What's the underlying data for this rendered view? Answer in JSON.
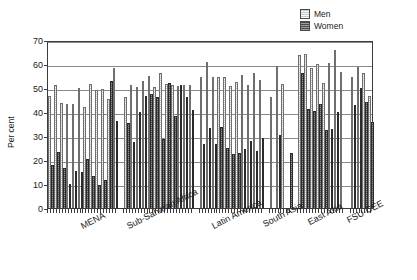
{
  "chart_data": {
    "type": "bar",
    "title": "",
    "subtitle": "",
    "xlabel": "",
    "ylabel": "Per cent",
    "ylim": [
      0,
      70
    ],
    "ytick_values": [
      0,
      10,
      20,
      30,
      40,
      50,
      60,
      70
    ],
    "ytick_labels": [
      "0",
      "10",
      "20",
      "30",
      "40",
      "50",
      "60",
      "70"
    ],
    "grid": "horizontal",
    "legend_position": "top-right",
    "legend": [
      "Men",
      "Women"
    ],
    "series_colors": {
      "Men": "#c6c6c6",
      "Women": "#4f4f4f"
    },
    "groups": [
      {
        "label": "MENA",
        "pairs": [
          {
            "men": 46.5,
            "women": 17.8
          },
          {
            "men": 51.3,
            "women": 23.2
          },
          {
            "men": 43.6,
            "women": 16.8
          },
          {
            "men": 43.3,
            "women": 10.2
          },
          {
            "men": 43.4,
            "women": 15.3
          },
          {
            "men": 50.1,
            "women": 14.8
          },
          {
            "men": 41.9,
            "women": 20.3
          },
          {
            "men": 51.5,
            "women": 13.5
          },
          {
            "men": 49.3,
            "women": 9.6
          },
          {
            "men": 49.4,
            "women": 11.5
          },
          {
            "men": 45.6,
            "women": 52.8
          },
          {
            "men": 58.4,
            "women": 36.2
          }
        ]
      },
      {
        "label": "Sub-Saharan Africa",
        "pairs": [
          {
            "men": 46.4,
            "women": 35.6
          },
          {
            "men": 51.4,
            "women": 27.3
          },
          {
            "men": 50.6,
            "women": 40.2
          },
          {
            "men": 53.0,
            "women": 46.6
          },
          {
            "men": 54.8,
            "women": 47.3
          },
          {
            "men": 50.4,
            "women": 46.4
          },
          {
            "men": 56.3,
            "women": 28.8
          },
          {
            "men": 51.7,
            "women": 52.0
          },
          {
            "men": 51.4,
            "women": 38.3
          },
          {
            "men": 50.9,
            "women": 51.3
          },
          {
            "men": 51.2,
            "women": 46.4
          },
          {
            "men": 51.2,
            "women": 41.0
          }
        ]
      },
      {
        "label": "Latin America",
        "pairs": [
          {
            "men": 54.6,
            "women": 26.6
          },
          {
            "men": 60.8,
            "women": 33.2
          },
          {
            "men": 54.4,
            "women": 26.7
          },
          {
            "men": 54.5,
            "women": 33.8
          },
          {
            "men": 54.7,
            "women": 25.0
          },
          {
            "men": 51.0,
            "women": 22.4
          },
          {
            "men": 52.3,
            "women": 23.1
          },
          {
            "men": 55.6,
            "women": 24.5
          },
          {
            "men": 51.4,
            "women": 27.8
          },
          {
            "men": 56.2,
            "women": 23.7
          },
          {
            "men": 53.4,
            "women": 29.1
          }
        ]
      },
      {
        "label": "South Asia",
        "pairs": [
          {
            "men": 46.4,
            "women": 0.0
          },
          {
            "men": 59.3,
            "women": 30.4
          },
          {
            "men": 51.8,
            "women": 0.0
          },
          {
            "men": 0.0,
            "women": 22.8
          }
        ]
      },
      {
        "label": "East Asia",
        "pairs": [
          {
            "men": 63.8,
            "women": 56.4
          },
          {
            "men": 64.2,
            "women": 41.4
          },
          {
            "men": 58.4,
            "women": 40.4
          },
          {
            "men": 59.9,
            "women": 43.2
          },
          {
            "men": 52.2,
            "women": 32.6
          },
          {
            "men": 60.5,
            "women": 33.0
          },
          {
            "men": 65.8,
            "women": 40.2
          },
          {
            "men": 56.6,
            "women": 0.0
          }
        ]
      },
      {
        "label": "FSU-CEE",
        "pairs": [
          {
            "men": 54.5,
            "women": 42.8
          },
          {
            "men": 58.9,
            "women": 50.0
          },
          {
            "men": 56.3,
            "women": 44.2
          },
          {
            "men": 46.6,
            "women": 35.8
          }
        ]
      }
    ]
  }
}
